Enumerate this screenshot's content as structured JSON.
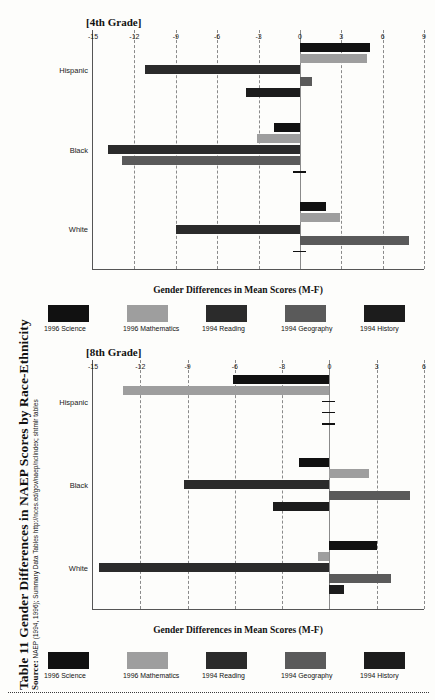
{
  "caption": {
    "title": "Table 11  Gender Differences in NAEP Scores by Race-Ethnicity",
    "source_label": "Source:",
    "source_text": "NAEP (1994, 1996); Summary Data Tables http://nces.ed/gov/naep/nclindex; shtmlr tables"
  },
  "legend": {
    "items": [
      {
        "label": "1996 Science",
        "color": "#111111"
      },
      {
        "label": "1996 Mathematics",
        "color": "#9e9e9e"
      },
      {
        "label": "1994 Reading",
        "color": "#2b2b2b"
      },
      {
        "label": "1994 Geography",
        "color": "#5a5a5a"
      },
      {
        "label": "1994 History",
        "color": "#1c1c1c"
      }
    ]
  },
  "chart_data": [
    {
      "id": "grade4",
      "type": "bar",
      "orientation": "horizontal",
      "title": "[4th Grade]",
      "xlabel": "Gender Differences in Mean Scores (M-F)",
      "ylabel": "",
      "xlim": [
        -15,
        9
      ],
      "xticks": [
        -15,
        -12,
        -9,
        -6,
        -3,
        0,
        3,
        6,
        9
      ],
      "grid": true,
      "legend_position": "bottom",
      "categories": [
        "Hispanic",
        "Black",
        "White"
      ],
      "series": [
        {
          "name": "1996 Science",
          "color": "#111111",
          "values": [
            5.1,
            -1.9,
            1.9
          ]
        },
        {
          "name": "1996 Mathematics",
          "color": "#9e9e9e",
          "values": [
            4.9,
            -3.1,
            2.9
          ]
        },
        {
          "name": "1994 Reading",
          "color": "#2b2b2b",
          "values": [
            -11.2,
            -13.9,
            -9.0
          ]
        },
        {
          "name": "1994 Geography",
          "color": "#5a5a5a",
          "values": [
            0.9,
            -12.9,
            7.9
          ]
        },
        {
          "name": "1994 History",
          "color": "#1c1c1c",
          "values": [
            -3.9,
            0.15,
            0.15
          ]
        }
      ]
    },
    {
      "id": "grade8",
      "type": "bar",
      "orientation": "horizontal",
      "title": "[8th Grade]",
      "xlabel": "Gender Differences in Mean Scores (M-F)",
      "ylabel": "",
      "xlim": [
        -15,
        6
      ],
      "xticks": [
        -15,
        -12,
        -9,
        -6,
        -3,
        0,
        3,
        6
      ],
      "grid": true,
      "legend_position": "bottom",
      "categories": [
        "Hispanic",
        "Black",
        "White"
      ],
      "series": [
        {
          "name": "1996 Science",
          "color": "#111111",
          "values": [
            -6.1,
            -1.9,
            3.0
          ]
        },
        {
          "name": "1996 Mathematics",
          "color": "#9e9e9e",
          "values": [
            -13.1,
            2.5,
            -0.7
          ]
        },
        {
          "name": "1994 Reading",
          "color": "#2b2b2b",
          "values": [
            0.15,
            -9.2,
            -14.6
          ]
        },
        {
          "name": "1994 Geography",
          "color": "#5a5a5a",
          "values": [
            0.0,
            5.1,
            3.9
          ]
        },
        {
          "name": "1994 History",
          "color": "#1c1c1c",
          "values": [
            0.0,
            -3.6,
            0.9
          ]
        }
      ],
      "extra_marks": [
        {
          "category": "Black",
          "series": "1994 History",
          "value": 0.15
        }
      ]
    }
  ]
}
